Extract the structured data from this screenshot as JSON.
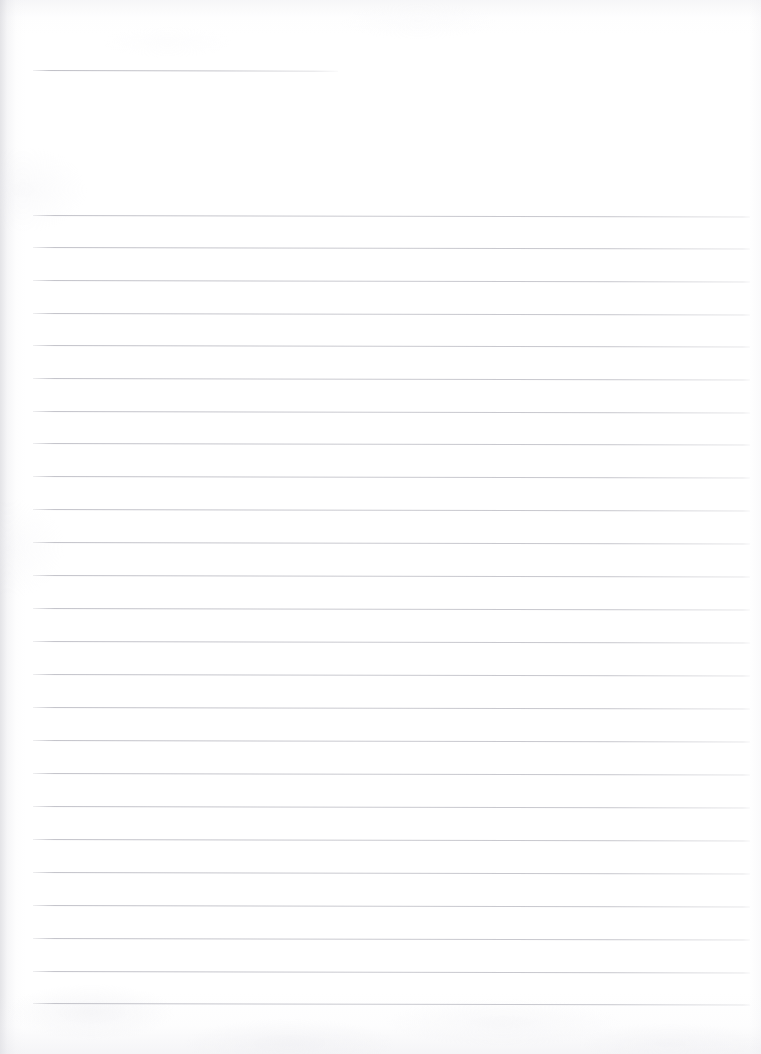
{
  "document": {
    "kind": "scanned-page",
    "title": "Blank ruled notebook page",
    "page_width": 761,
    "page_height": 1054,
    "background_color": "#ffffff",
    "rule_color": "#c9c9ce",
    "shadow_color": "#e3e3e8",
    "visible_text": "",
    "handwriting": "none",
    "notes": "No text, numbers, labels or marks are present on the page."
  },
  "layout": {
    "margin_left_px": 33,
    "margin_right_px": 750,
    "first_rule_y_px": 215,
    "last_rule_y_px": 1003,
    "rule_spacing_px": 32.8,
    "rule_thickness_px": 1,
    "rule_count": 25,
    "page_tilt_deg": 0.12
  },
  "header_rule": {
    "name": "short-top-rule",
    "x_start_px": 33,
    "x_end_px": 338,
    "y_px": 70,
    "length_px": 305
  },
  "rules": [
    {
      "index": 1,
      "y": 215,
      "x_start": 33,
      "x_end": 750
    },
    {
      "index": 2,
      "y": 247,
      "x_start": 33,
      "x_end": 750
    },
    {
      "index": 3,
      "y": 280,
      "x_start": 33,
      "x_end": 750
    },
    {
      "index": 4,
      "y": 313,
      "x_start": 33,
      "x_end": 750
    },
    {
      "index": 5,
      "y": 345,
      "x_start": 33,
      "x_end": 750
    },
    {
      "index": 6,
      "y": 378,
      "x_start": 33,
      "x_end": 750
    },
    {
      "index": 7,
      "y": 411,
      "x_start": 33,
      "x_end": 750
    },
    {
      "index": 8,
      "y": 443,
      "x_start": 33,
      "x_end": 750
    },
    {
      "index": 9,
      "y": 476,
      "x_start": 33,
      "x_end": 750
    },
    {
      "index": 10,
      "y": 509,
      "x_start": 33,
      "x_end": 750
    },
    {
      "index": 11,
      "y": 542,
      "x_start": 33,
      "x_end": 750
    },
    {
      "index": 12,
      "y": 575,
      "x_start": 33,
      "x_end": 750
    },
    {
      "index": 13,
      "y": 608,
      "x_start": 33,
      "x_end": 750
    },
    {
      "index": 14,
      "y": 641,
      "x_start": 33,
      "x_end": 750
    },
    {
      "index": 15,
      "y": 674,
      "x_start": 33,
      "x_end": 750
    },
    {
      "index": 16,
      "y": 707,
      "x_start": 33,
      "x_end": 750
    },
    {
      "index": 17,
      "y": 740,
      "x_start": 33,
      "x_end": 750
    },
    {
      "index": 18,
      "y": 773,
      "x_start": 33,
      "x_end": 750
    },
    {
      "index": 19,
      "y": 806,
      "x_start": 33,
      "x_end": 750
    },
    {
      "index": 20,
      "y": 839,
      "x_start": 33,
      "x_end": 750
    },
    {
      "index": 21,
      "y": 872,
      "x_start": 33,
      "x_end": 750
    },
    {
      "index": 22,
      "y": 905,
      "x_start": 33,
      "x_end": 750
    },
    {
      "index": 23,
      "y": 938,
      "x_start": 33,
      "x_end": 750
    },
    {
      "index": 24,
      "y": 971,
      "x_start": 33,
      "x_end": 750
    },
    {
      "index": 25,
      "y": 1003,
      "x_start": 33,
      "x_end": 750
    }
  ]
}
